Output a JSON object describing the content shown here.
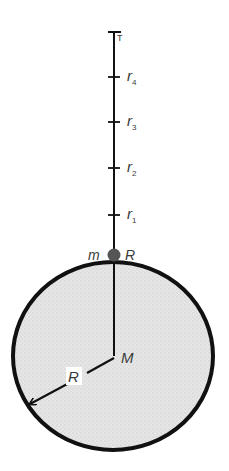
{
  "figure": {
    "colors": {
      "ink": "#111111",
      "planet_fill": "#e4e4e4",
      "label": "#3a3a3a",
      "background": "#ffffff"
    },
    "axis": {
      "top_label": "T",
      "ticks": [
        {
          "base": "r",
          "sub": "4"
        },
        {
          "base": "r",
          "sub": "3"
        },
        {
          "base": "r",
          "sub": "2"
        },
        {
          "base": "r",
          "sub": "1"
        }
      ]
    },
    "particle": {
      "mass_label": "m",
      "position_label": "R"
    },
    "planet": {
      "center_label": "M",
      "radius_label": "R"
    }
  }
}
